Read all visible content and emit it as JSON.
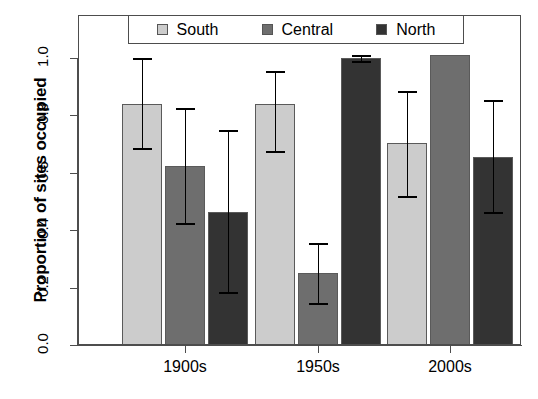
{
  "chart_data": {
    "type": "bar",
    "title": "",
    "xlabel": "",
    "ylabel": "Proportion of sites occupied",
    "ylim": [
      0.0,
      1.0
    ],
    "grid": false,
    "legend_position": "top",
    "categories": [
      "1900s",
      "1950s",
      "2000s"
    ],
    "ytick_labels": [
      "0.0",
      "0.2",
      "0.4",
      "0.6",
      "0.8",
      "1.0"
    ],
    "ytick_values": [
      0.0,
      0.2,
      0.4,
      0.6,
      0.8,
      1.0
    ],
    "series": [
      {
        "name": "South",
        "color": "#cccccc",
        "values": [
          0.84,
          0.84,
          0.705
        ],
        "err_low": [
          0.685,
          0.675,
          0.52
        ],
        "err_high": [
          1.0,
          0.955,
          0.885
        ]
      },
      {
        "name": "Central",
        "color": "#6e6e6e",
        "values": [
          0.625,
          0.25,
          1.01
        ],
        "err_low": [
          0.425,
          0.145,
          null
        ],
        "err_high": [
          0.825,
          0.355,
          null
        ]
      },
      {
        "name": "North",
        "color": "#333333",
        "values": [
          0.465,
          1.0,
          0.655
        ],
        "err_low": [
          0.185,
          0.99,
          0.465
        ],
        "err_high": [
          0.75,
          1.01,
          0.855
        ]
      }
    ]
  },
  "legend": {
    "entries": [
      {
        "label": "South",
        "swatch_color": "#cccccc",
        "icon": "square-swatch-icon"
      },
      {
        "label": "Central",
        "swatch_color": "#6e6e6e",
        "icon": "square-swatch-icon"
      },
      {
        "label": "North",
        "swatch_color": "#333333",
        "icon": "square-swatch-icon"
      }
    ]
  },
  "axes": {
    "y_title": "Proportion of sites occupied",
    "y_ticks": [
      "0.0",
      "0.2",
      "0.4",
      "0.6",
      "0.8",
      "1.0"
    ],
    "x_ticks": [
      "1900s",
      "1950s",
      "2000s"
    ]
  }
}
